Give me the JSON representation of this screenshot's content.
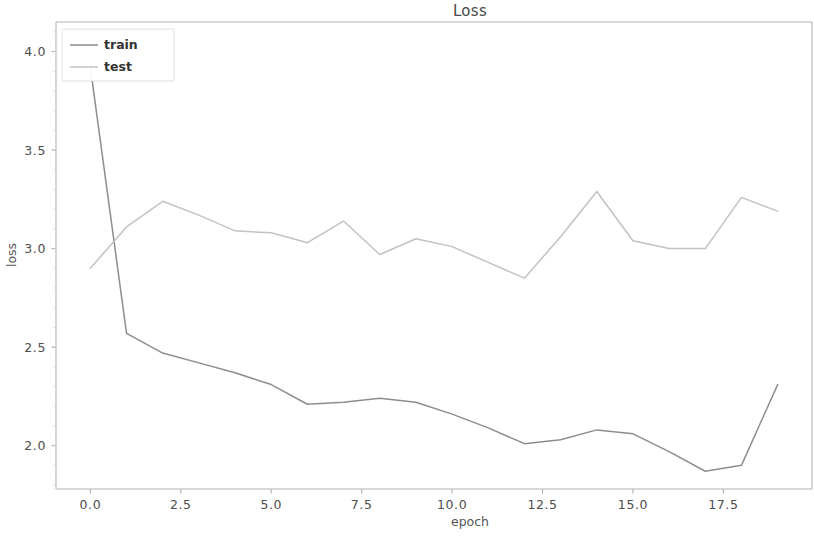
{
  "figure": {
    "width": 814,
    "height": 537,
    "background": "#ffffff"
  },
  "chart_data": {
    "type": "line",
    "title": "Loss",
    "xlabel": "epoch",
    "ylabel": "loss",
    "x": [
      0,
      1,
      2,
      3,
      4,
      5,
      6,
      7,
      8,
      9,
      10,
      11,
      12,
      13,
      14,
      15,
      16,
      17,
      18,
      19
    ],
    "series": [
      {
        "name": "train",
        "color": "#8d8d8d",
        "values": [
          3.92,
          2.57,
          2.47,
          2.42,
          2.37,
          2.31,
          2.21,
          2.22,
          2.24,
          2.22,
          2.16,
          2.09,
          2.01,
          2.03,
          2.08,
          2.06,
          1.97,
          1.87,
          1.9,
          2.31
        ]
      },
      {
        "name": "test",
        "color": "#c2c2c2",
        "values": [
          2.9,
          3.11,
          3.24,
          3.17,
          3.09,
          3.08,
          3.03,
          3.14,
          2.97,
          3.05,
          3.01,
          2.93,
          2.85,
          3.06,
          3.29,
          3.04,
          3.0,
          3.0,
          3.26,
          3.19
        ]
      }
    ],
    "xlim": [
      -0.95,
      19.95
    ],
    "ylim": [
      1.78,
      4.15
    ],
    "xticks": [
      0.0,
      2.5,
      5.0,
      7.5,
      10.0,
      12.5,
      15.0,
      17.5
    ],
    "xtick_labels": [
      "0.0",
      "2.5",
      "5.0",
      "7.5",
      "10.0",
      "12.5",
      "15.0",
      "17.5"
    ],
    "yticks": [
      2.0,
      2.5,
      3.0,
      3.5,
      4.0
    ],
    "ytick_labels": [
      "2.0",
      "2.5",
      "3.0",
      "3.5",
      "4.0"
    ],
    "grid": false,
    "legend_position": "upper left",
    "legend_entries": [
      "train",
      "test"
    ]
  },
  "axes": {
    "spine_color": "#b4b4b4",
    "tick_color": "#b0b0b0"
  }
}
